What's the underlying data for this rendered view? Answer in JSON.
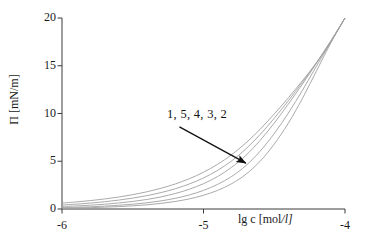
{
  "chart_data": {
    "type": "line",
    "title": "",
    "xlabel": "lg c [mol/l]",
    "ylabel": "Π [mN/m]",
    "xlim": [
      -6,
      -4
    ],
    "ylim": [
      0,
      20
    ],
    "xticks": [
      "-6",
      "-5",
      "-4"
    ],
    "xtick_values": [
      -6,
      -5,
      -4
    ],
    "yticks": [
      "0",
      "5",
      "10",
      "15",
      "20"
    ],
    "ytick_values": [
      0,
      5,
      10,
      15,
      20
    ],
    "grid": false,
    "legend_position": "none",
    "line_color": "#a0a0a0",
    "annotation_color": "#111111",
    "annotations": [
      {
        "text": "1, 5, 4, 3, 2",
        "x": -5.18,
        "y": 10.1,
        "arrow_from": [
          -5.17,
          8.6
        ],
        "arrow_to": [
          -4.7,
          4.8
        ]
      }
    ],
    "x": [
      -6.0,
      -5.9,
      -5.8,
      -5.7,
      -5.6,
      -5.5,
      -5.4,
      -5.3,
      -5.2,
      -5.1,
      -5.0,
      -4.9,
      -4.8,
      -4.7,
      -4.6,
      -4.5,
      -4.4,
      -4.3,
      -4.2,
      -4.1,
      -4.0
    ],
    "series": [
      {
        "name": "1",
        "label": "1",
        "values": [
          0.62,
          0.74,
          0.88,
          1.05,
          1.25,
          1.5,
          1.8,
          2.17,
          2.62,
          3.17,
          3.85,
          4.68,
          5.7,
          6.92,
          8.35,
          9.95,
          11.65,
          13.45,
          15.35,
          17.5,
          20.0
        ]
      },
      {
        "name": "5",
        "label": "5",
        "values": [
          0.42,
          0.51,
          0.62,
          0.76,
          0.93,
          1.14,
          1.4,
          1.72,
          2.12,
          2.62,
          3.25,
          4.05,
          5.05,
          6.3,
          7.8,
          9.5,
          11.35,
          13.3,
          15.35,
          17.6,
          20.0
        ]
      },
      {
        "name": "4",
        "label": "4",
        "values": [
          0.26,
          0.32,
          0.4,
          0.5,
          0.63,
          0.79,
          1.0,
          1.27,
          1.62,
          2.07,
          2.65,
          3.4,
          4.38,
          5.62,
          7.18,
          9.0,
          11.0,
          13.1,
          15.3,
          17.6,
          20.0
        ]
      },
      {
        "name": "3",
        "label": "3",
        "values": [
          0.14,
          0.18,
          0.23,
          0.3,
          0.39,
          0.5,
          0.65,
          0.85,
          1.12,
          1.47,
          1.95,
          2.58,
          3.42,
          4.55,
          6.05,
          7.9,
          10.05,
          12.45,
          15.0,
          17.5,
          20.0
        ]
      },
      {
        "name": "2",
        "label": "2",
        "values": [
          0.08,
          0.11,
          0.14,
          0.19,
          0.25,
          0.33,
          0.44,
          0.59,
          0.79,
          1.06,
          1.44,
          1.95,
          2.66,
          3.64,
          5.0,
          6.8,
          9.0,
          11.6,
          14.5,
          17.4,
          20.0
        ]
      }
    ]
  },
  "axis": {
    "xlabel_pre": "lg c [mol",
    "xlabel_slash": "/",
    "xlabel_post": "l]"
  }
}
